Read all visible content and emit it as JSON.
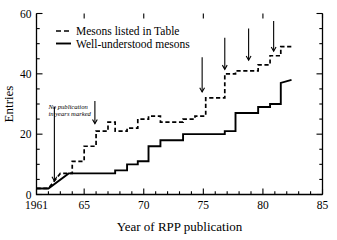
{
  "chart_data": {
    "type": "line",
    "title": "",
    "xlabel": "Year of RPP publication",
    "ylabel": "Entries",
    "xlim": [
      1961,
      1985
    ],
    "ylim": [
      0,
      60
    ],
    "xticks_major": [
      1961,
      65,
      70,
      75,
      80,
      85
    ],
    "xtick_labels": [
      "1961",
      "65",
      "70",
      "75",
      "80",
      "85"
    ],
    "yticks_major": [
      0,
      20,
      40,
      60
    ],
    "ytick_labels": [
      "0",
      "20",
      "40",
      "60"
    ],
    "xtick_minor_step": 1,
    "ytick_minor_step": 5,
    "grid": false,
    "legend_position": "upper-left-inside",
    "series": [
      {
        "name": "Mesons listed in Table",
        "style": "dashed",
        "x": [
          1961,
          1962,
          1963,
          1964,
          1964,
          1965,
          1965,
          1966,
          1966,
          1967,
          1967,
          1967.6,
          1967.6,
          1968.6,
          1968.6,
          1969.5,
          1969.5,
          1970.4,
          1970.4,
          1971.4,
          1971.4,
          1973.3,
          1973.3,
          1974.3,
          1974.3,
          1975.2,
          1975.2,
          1976.8,
          1976.8,
          1977.7,
          1977.7,
          1979.6,
          1979.6,
          1980.6,
          1980.6,
          1981.5,
          1981.5,
          1982.4
        ],
        "y": [
          2,
          2,
          7,
          7,
          11,
          11,
          16,
          16,
          21,
          21,
          24,
          24,
          21,
          21,
          22,
          22,
          25,
          25,
          26,
          26,
          24,
          24,
          25,
          25,
          26,
          26,
          32,
          32,
          40,
          40,
          41,
          41,
          43,
          43,
          46,
          46,
          49,
          49
        ]
      },
      {
        "name": "Well-understood mesons",
        "style": "solid",
        "x": [
          1961,
          1962,
          1963.7,
          1967.6,
          1967.6,
          1968.6,
          1968.6,
          1969.5,
          1969.5,
          1970.4,
          1970.4,
          1971.4,
          1971.4,
          1973.3,
          1973.3,
          1976.8,
          1976.8,
          1977.7,
          1977.7,
          1979.6,
          1979.6,
          1980.6,
          1980.6,
          1981.5,
          1981.5,
          1982.4
        ],
        "y": [
          2,
          2,
          7,
          7,
          8,
          8,
          10,
          10,
          11,
          11,
          16,
          16,
          18,
          18,
          20,
          20,
          21,
          21,
          27,
          27,
          29,
          29,
          30,
          30,
          37,
          38
        ]
      }
    ],
    "annotations": [
      {
        "name": "no-publication-note",
        "text_line1": "No publication",
        "text_line2": "in years marked",
        "x": 1962.0,
        "y": 28.5
      }
    ],
    "arrows": [
      {
        "name": "arrow-1962",
        "x": 1962.5,
        "y_top": 29.0,
        "y_tip": 4.5
      },
      {
        "name": "arrow-1966",
        "x": 1965.9,
        "y_top": 31.0,
        "y_tip": 23.5
      },
      {
        "name": "arrow-1975",
        "x": 1974.9,
        "y_top": 45.5,
        "y_tip": 34.0
      },
      {
        "name": "arrow-1977",
        "x": 1976.8,
        "y_top": 52.0,
        "y_tip": 41.5
      },
      {
        "name": "arrow-1979",
        "x": 1978.8,
        "y_top": 55.0,
        "y_tip": 44.5
      },
      {
        "name": "arrow-1981",
        "x": 1980.9,
        "y_top": 57.5,
        "y_tip": 47.5
      }
    ],
    "legend": [
      {
        "name": "Mesons listed in Table",
        "style": "dashed"
      },
      {
        "name": "Well-understood mesons",
        "style": "solid"
      }
    ]
  }
}
